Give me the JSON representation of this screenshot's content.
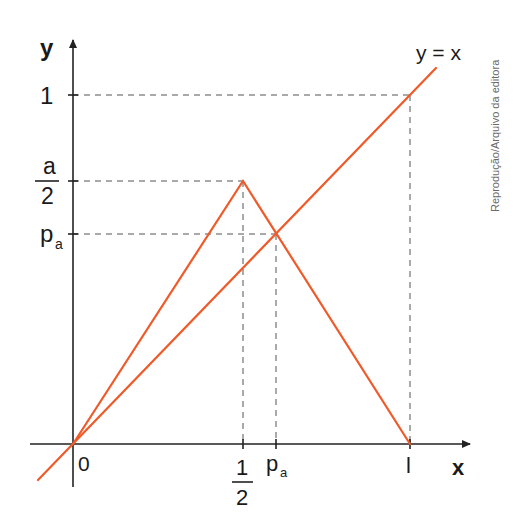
{
  "diagram": {
    "type": "function-graph",
    "axes": {
      "x_label": "x",
      "y_label": "y",
      "origin_label": "0"
    },
    "y_ticks": [
      {
        "id": "one",
        "label": "1"
      },
      {
        "id": "a_over_2",
        "numerator": "a",
        "denominator": "2"
      },
      {
        "id": "p_a",
        "label": "p",
        "subscript": "a"
      }
    ],
    "x_ticks": [
      {
        "id": "half",
        "numerator": "1",
        "denominator": "2"
      },
      {
        "id": "p_a",
        "label": "p",
        "subscript": "a"
      },
      {
        "id": "one",
        "label": "l"
      }
    ],
    "curves": [
      {
        "id": "identity",
        "label": "y = x",
        "color": "#f05a28"
      },
      {
        "id": "tent",
        "label": "tent map with peak a/2 at x = 1/2",
        "color": "#f05a28"
      }
    ],
    "guide_color": "#555555",
    "axis_color": "#222222",
    "credit": "Reprodução/Arquivo da editora"
  }
}
